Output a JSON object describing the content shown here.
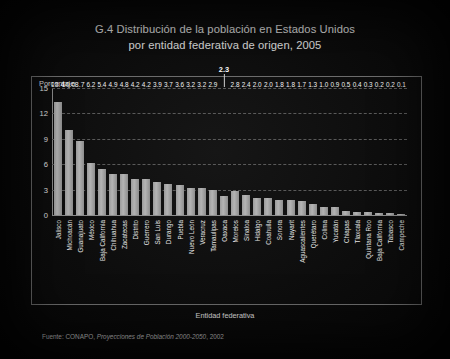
{
  "slide": {
    "title_line1": "G.4 Distribución de la población en Estados Unidos",
    "title_line2": "por entidad federativa de origen, 2005",
    "source_prefix": "Fuente: CONAPO, ",
    "source_italic": "Proyecciones de Población 2000-2050",
    "source_suffix": ", 2002",
    "accent_color": "#b4b4b4",
    "background_color": "#0b0b0b"
  },
  "chart_data": {
    "type": "bar",
    "title": "G.4 Distribución de la población en Estados Unidos por entidad federativa de origen, 2005",
    "xlabel": "Entidad federativa",
    "ylabel": "Porcentaje",
    "ylim": [
      0,
      15
    ],
    "yticks": [
      "0",
      "3",
      "6",
      "9",
      "12",
      "15"
    ],
    "grid": true,
    "legend": "none",
    "highlight_category": "Oaxaca",
    "categories": [
      "Jalisco",
      "Michoacán",
      "Guanajuato",
      "México",
      "Baja California",
      "Chihuahua",
      "Zacatecas",
      "Distrito",
      "Guerrero",
      "San Luis",
      "Durango",
      "Puebla",
      "Nuevo León",
      "Veracruz",
      "Tamaulipas",
      "Oaxaca",
      "Morelos",
      "Sinaloa",
      "Hidalgo",
      "Coahuila",
      "Sonora",
      "Nayarit",
      "Aguascalientes",
      "Querétaro",
      "Colima",
      "Yucatán",
      "Chiapas",
      "Tlaxcala",
      "Quintana Roo",
      "Baja California",
      "Tabasco",
      "Campeche"
    ],
    "values": [
      13.4,
      10.0,
      8.7,
      6.2,
      5.4,
      4.9,
      4.8,
      4.2,
      4.2,
      3.9,
      3.7,
      3.6,
      3.2,
      3.2,
      2.9,
      2.3,
      2.8,
      2.4,
      2.0,
      2.0,
      1.8,
      1.8,
      1.7,
      1.3,
      1.0,
      0.9,
      0.5,
      0.4,
      0.3,
      0.2,
      0.2,
      0.1
    ],
    "labels": [
      "13.4",
      "10.0",
      "8.7",
      "6.2",
      "5.4",
      "4.9",
      "4.8",
      "4.2",
      "4.2",
      "3.9",
      "3.7",
      "3.6",
      "3.2",
      "3.2",
      "2.9",
      "2.3",
      "2.8",
      "2.4",
      "2.0",
      "2.0",
      "1.8",
      "1.8",
      "1.7",
      "1.3",
      "1.0",
      "0.9",
      "0.5",
      "0.4",
      "0.3",
      "0.2",
      "0.2",
      "0.1"
    ]
  }
}
